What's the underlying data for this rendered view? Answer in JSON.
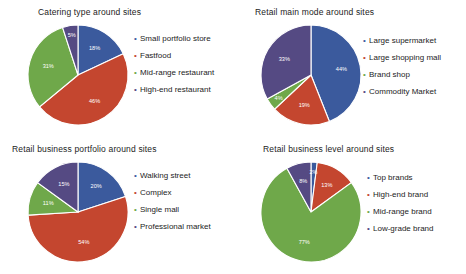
{
  "figure": {
    "background": "#ffffff",
    "palette": {
      "blue": "#3b5a9d",
      "red": "#c4462f",
      "green": "#6fa84a",
      "purple": "#554a83",
      "slice_border": "#ffffff",
      "label_text": "#ffffff",
      "title_text": "#1c1c1c"
    },
    "legend_bullet_glyph": "•"
  },
  "chart_data": [
    {
      "type": "pie",
      "title": "Catering type around sites",
      "labels": [
        "Small portfolio store",
        "Fastfood",
        "Mid-range restaurant",
        "High-end restaurant"
      ],
      "values": [
        18,
        46,
        31,
        5
      ],
      "value_labels": [
        "18%",
        "46%",
        "31%",
        "5%"
      ],
      "colors": [
        "#3b5a9d",
        "#c4462f",
        "#6fa84a",
        "#554a83"
      ],
      "legend_position": "right",
      "start_angle": 0,
      "direction": "clockwise"
    },
    {
      "type": "pie",
      "title": "Retail main mode around sites",
      "labels": [
        "Large supermarket",
        "Large shopping mall",
        "Brand shop",
        "Commodity Market"
      ],
      "values": [
        44,
        19,
        4,
        33
      ],
      "value_labels": [
        "44%",
        "19%",
        "4%",
        "33%"
      ],
      "colors": [
        "#3b5a9d",
        "#c4462f",
        "#6fa84a",
        "#554a83"
      ],
      "legend_position": "right",
      "start_angle": 0,
      "direction": "clockwise"
    },
    {
      "type": "pie",
      "title": "Retail business portfolio around sites",
      "labels": [
        "Walking street",
        "Complex",
        "Single mall",
        "Professional market"
      ],
      "values": [
        20,
        54,
        11,
        15
      ],
      "value_labels": [
        "20%",
        "54%",
        "11%",
        "15%"
      ],
      "colors": [
        "#3b5a9d",
        "#c4462f",
        "#6fa84a",
        "#554a83"
      ],
      "legend_position": "right",
      "start_angle": 0,
      "direction": "clockwise"
    },
    {
      "type": "pie",
      "title": "Retail business level around sites",
      "labels": [
        "Top brands",
        "High-end brand",
        "Mid-range brand",
        "Low-grade brand"
      ],
      "values": [
        2,
        13,
        77,
        8
      ],
      "value_labels": [
        "2%",
        "13%",
        "77%",
        "8%"
      ],
      "colors": [
        "#3b5a9d",
        "#c4462f",
        "#6fa84a",
        "#554a83"
      ],
      "legend_position": "right",
      "start_angle": 0,
      "direction": "clockwise"
    }
  ]
}
